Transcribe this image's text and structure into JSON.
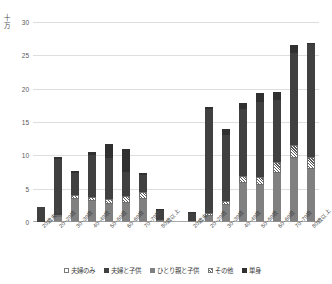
{
  "chart_data": {
    "type": "bar",
    "subtype": "stacked-column",
    "title": "",
    "xlabel": "",
    "ylabel": "十万",
    "ylim": [
      0,
      30
    ],
    "ytick_values": [
      0,
      5,
      10,
      15,
      20,
      25,
      30
    ],
    "ytick_labels": [
      "0",
      "5",
      "10",
      "15",
      "20",
      "25",
      "30"
    ],
    "grid": true,
    "legend_position": "bottom",
    "categories": [
      "20歳未満",
      "20~29歳",
      "30~39歳",
      "40~49歳",
      "50~59歳",
      "60~69歳",
      "70~79歳",
      "80歳以上",
      "20歳未満",
      "20~29歳",
      "30~39歳",
      "40~49歳",
      "50~59歳",
      "60~69歳",
      "70~79歳",
      "80歳以上"
    ],
    "group_labels": [
      "グループ1",
      "グループ2"
    ],
    "series": [
      {
        "name": "夫婦のみ",
        "color": "#ffffff",
        "values": [
          0.0,
          0.1,
          0.1,
          0.1,
          0.1,
          0.1,
          0.1,
          0.0,
          0.0,
          0.1,
          0.1,
          0.1,
          0.1,
          0.1,
          0.1,
          0.1
        ]
      },
      {
        "name": "夫婦と子供",
        "color": "#404040",
        "values": [
          2.2,
          8.4,
          3.2,
          6.4,
          6.1,
          3.6,
          2.6,
          1.5,
          1.3,
          15.6,
          9.9,
          10.1,
          11.2,
          9.3,
          13.9,
          17.0
        ]
      },
      {
        "name": "ひとり親と子供",
        "color": "#808080",
        "values": [
          0.0,
          0.7,
          3.4,
          3.0,
          2.6,
          2.8,
          3.3,
          0.2,
          0.1,
          0.8,
          2.4,
          5.8,
          5.5,
          7.3,
          9.5,
          7.9
        ]
      },
      {
        "name": "その他",
        "color": "#5a5a5a",
        "pattern": "diagonal-hatch",
        "values": [
          0.0,
          0.3,
          0.6,
          0.6,
          0.8,
          1.0,
          1.1,
          0.1,
          0.0,
          0.4,
          0.7,
          1.0,
          1.2,
          1.6,
          1.9,
          1.7
        ]
      },
      {
        "name": "単身",
        "color": "#303030",
        "values": [
          0.0,
          0.2,
          0.3,
          0.4,
          2.1,
          3.5,
          0.2,
          0.1,
          0.1,
          0.3,
          0.8,
          0.9,
          1.3,
          1.2,
          1.1,
          0.2
        ]
      }
    ],
    "totals": [
      2.2,
      9.7,
      7.6,
      10.5,
      11.7,
      11.0,
      7.3,
      1.9,
      1.5,
      17.2,
      13.9,
      17.9,
      19.3,
      19.5,
      26.5,
      26.9
    ]
  },
  "legend": {
    "items": [
      {
        "label": "夫婦のみ"
      },
      {
        "label": "夫婦と子供"
      },
      {
        "label": "ひとり親と子供"
      },
      {
        "label": "その他"
      },
      {
        "label": "単身"
      }
    ]
  },
  "axis": {
    "unit_label": "十万"
  }
}
